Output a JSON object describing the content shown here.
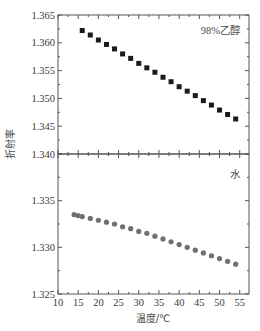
{
  "chart_data": {
    "type": "scatter",
    "layout": "two stacked panels sharing x-axis",
    "xlabel": "温度/℃",
    "ylabel": "折射率",
    "xlim": [
      10,
      57.3
    ],
    "xticks": [
      10,
      15,
      20,
      25,
      30,
      35,
      40,
      45,
      50,
      55
    ],
    "grid": false,
    "panels": [
      {
        "position": "top",
        "annotation": "98%乙醇",
        "annotation_placement": "top-right",
        "ylim": [
          1.34,
          1.365
        ],
        "yticks": [
          1.34,
          1.345,
          1.35,
          1.355,
          1.36,
          1.365
        ],
        "ytick_labels": [
          "1.340",
          "1.345",
          "1.350",
          "1.355",
          "1.360",
          "1.365"
        ],
        "series": [
          {
            "name": "98%乙醇",
            "marker": "square",
            "color": "#1a1a1a",
            "x": [
              16,
              18,
              20,
              22,
              24,
              26,
              28,
              30,
              32,
              34,
              36,
              38,
              40,
              42,
              44,
              46,
              48,
              50,
              52,
              54
            ],
            "y": [
              1.3622,
              1.3614,
              1.3605,
              1.3597,
              1.3589,
              1.358,
              1.3572,
              1.3563,
              1.3555,
              1.3547,
              1.3538,
              1.353,
              1.3521,
              1.3513,
              1.3505,
              1.3496,
              1.3488,
              1.3479,
              1.3471,
              1.3463
            ]
          }
        ]
      },
      {
        "position": "bottom",
        "annotation": "水",
        "annotation_placement": "top-right",
        "ylim": [
          1.325,
          1.34
        ],
        "yticks": [
          1.325,
          1.33,
          1.335
        ],
        "ytick_labels": [
          "1.325",
          "1.330",
          "1.335"
        ],
        "series": [
          {
            "name": "水",
            "marker": "circle",
            "color": "#707070",
            "x": [
              14,
              15,
              16,
              18,
              20,
              22,
              24,
              26,
              28,
              30,
              32,
              34,
              36,
              38,
              40,
              42,
              44,
              46,
              48,
              50,
              52,
              54
            ],
            "y": [
              1.3335,
              1.3334,
              1.3333,
              1.3331,
              1.3329,
              1.3327,
              1.3325,
              1.3322,
              1.332,
              1.3317,
              1.3315,
              1.3312,
              1.3309,
              1.3306,
              1.3303,
              1.33,
              1.3297,
              1.3294,
              1.3291,
              1.3288,
              1.3285,
              1.3282
            ]
          }
        ]
      }
    ]
  }
}
